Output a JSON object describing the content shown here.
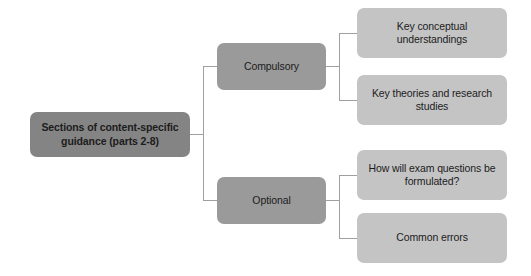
{
  "diagram": {
    "type": "hierarchy-tree",
    "orientation": "left-to-right",
    "background_color": "#ffffff",
    "connector_color": "#a0a0a0",
    "root": {
      "label": "Sections of content-specific guidance (parts 2-8)",
      "fill_color": "#848484",
      "text_color": "#1c1c1c"
    },
    "branches": [
      {
        "label": "Compulsory",
        "fill_color": "#9a9a9a",
        "children": [
          {
            "label": "Key conceptual understandings",
            "fill_color": "#c4c4c4"
          },
          {
            "label": "Key theories and research studies",
            "fill_color": "#c4c4c4"
          }
        ]
      },
      {
        "label": "Optional",
        "fill_color": "#9a9a9a",
        "children": [
          {
            "label": "How will exam questions be formulated?",
            "fill_color": "#c4c4c4"
          },
          {
            "label": "Common errors",
            "fill_color": "#c4c4c4"
          }
        ]
      }
    ]
  }
}
